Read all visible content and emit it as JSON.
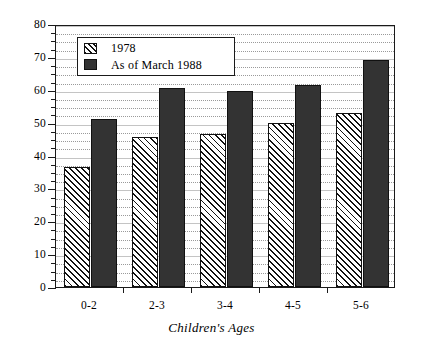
{
  "chart_data": {
    "type": "bar",
    "title": "",
    "subtitle": "",
    "xlabel": "Children's Ages",
    "ylabel": "",
    "categories": [
      "0-2",
      "2-3",
      "3-4",
      "4-5",
      "5-6"
    ],
    "series": [
      {
        "name": "1978",
        "values": [
          36.5,
          45.5,
          46.5,
          50,
          53
        ],
        "fill": "hatch",
        "color": "#ffffff"
      },
      {
        "name": "As of March 1988",
        "values": [
          51,
          60.5,
          59.5,
          61.5,
          69
        ],
        "fill": "solid",
        "color": "#333333"
      }
    ],
    "ylim": [
      0,
      80
    ],
    "ytick_step": 10,
    "yticks": [
      0,
      10,
      20,
      30,
      40,
      50,
      60,
      70,
      80
    ],
    "ytick_labels": [
      "0",
      "10",
      "20",
      "30",
      "40",
      "50",
      "60",
      "70",
      "80"
    ],
    "yminor_step": 2.5,
    "grid": true,
    "grid_axis": "y",
    "legend": [
      "1978",
      "As of March 1988"
    ],
    "legend_position": "upper left inside",
    "frame": true
  },
  "axes": {
    "x_title": "Children's Ages"
  },
  "legend": {
    "entries": [
      {
        "label": "1978",
        "swatch": "hatch-swatch"
      },
      {
        "label": "As of March 1988",
        "swatch": "solid-swatch"
      }
    ]
  }
}
